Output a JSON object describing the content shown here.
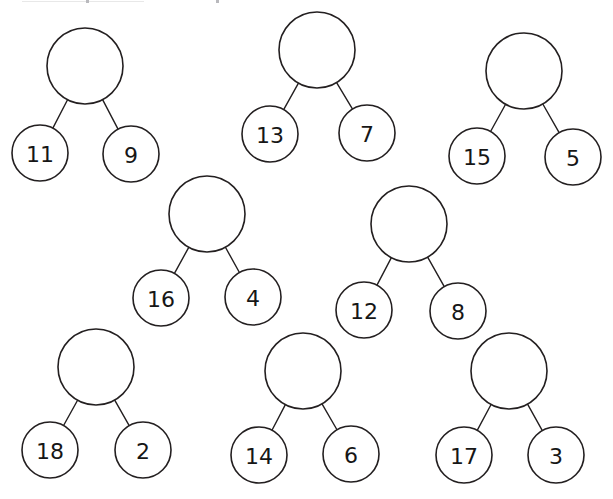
{
  "page": {
    "background_color": "#ffffff",
    "ink_color": "#231f20",
    "width": 613,
    "height": 499
  },
  "artifacts": {
    "top_rule_label": "cropped-toolbar-line",
    "top_tick_label": "cropped-toolbar-tick"
  },
  "diagram": {
    "type": "number-bond-trees",
    "parent_value": "",
    "parent_diameter": 76,
    "child_diameter": 56,
    "label_font_size": 22,
    "trees": [
      {
        "id": "tree-1",
        "parent": {
          "value": "",
          "cx": 85,
          "cy": 66,
          "r": 38
        },
        "left": {
          "value": "11",
          "cx": 40,
          "cy": 153,
          "r": 28
        },
        "right": {
          "value": "9",
          "cx": 131,
          "cy": 154,
          "r": 28
        }
      },
      {
        "id": "tree-2",
        "parent": {
          "value": "",
          "cx": 317,
          "cy": 50,
          "r": 38
        },
        "left": {
          "value": "13",
          "cx": 270,
          "cy": 134,
          "r": 28
        },
        "right": {
          "value": "7",
          "cx": 367,
          "cy": 133,
          "r": 28
        }
      },
      {
        "id": "tree-3",
        "parent": {
          "value": "",
          "cx": 524,
          "cy": 71,
          "r": 38
        },
        "left": {
          "value": "15",
          "cx": 477,
          "cy": 156,
          "r": 28
        },
        "right": {
          "value": "5",
          "cx": 573,
          "cy": 157,
          "r": 28
        }
      },
      {
        "id": "tree-4",
        "parent": {
          "value": "",
          "cx": 207,
          "cy": 214,
          "r": 38
        },
        "left": {
          "value": "16",
          "cx": 161,
          "cy": 298,
          "r": 28
        },
        "right": {
          "value": "4",
          "cx": 253,
          "cy": 297,
          "r": 28
        }
      },
      {
        "id": "tree-5",
        "parent": {
          "value": "",
          "cx": 409,
          "cy": 224,
          "r": 38
        },
        "left": {
          "value": "12",
          "cx": 364,
          "cy": 310,
          "r": 28
        },
        "right": {
          "value": "8",
          "cx": 458,
          "cy": 311,
          "r": 28
        }
      },
      {
        "id": "tree-6",
        "parent": {
          "value": "",
          "cx": 96,
          "cy": 367,
          "r": 38
        },
        "left": {
          "value": "18",
          "cx": 50,
          "cy": 450,
          "r": 28
        },
        "right": {
          "value": "2",
          "cx": 143,
          "cy": 450,
          "r": 28
        }
      },
      {
        "id": "tree-7",
        "parent": {
          "value": "",
          "cx": 303,
          "cy": 371,
          "r": 38
        },
        "left": {
          "value": "14",
          "cx": 259,
          "cy": 455,
          "r": 28
        },
        "right": {
          "value": "6",
          "cx": 351,
          "cy": 454,
          "r": 28
        }
      },
      {
        "id": "tree-8",
        "parent": {
          "value": "",
          "cx": 509,
          "cy": 371,
          "r": 38
        },
        "left": {
          "value": "17",
          "cx": 464,
          "cy": 455,
          "r": 28
        },
        "right": {
          "value": "3",
          "cx": 556,
          "cy": 455,
          "r": 28
        }
      }
    ]
  }
}
